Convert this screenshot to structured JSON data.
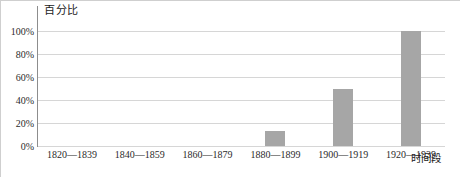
{
  "chart_data": {
    "type": "bar",
    "title": "",
    "ylabel": "百分比",
    "xlabel": "时间段",
    "categories": [
      "1820—1839",
      "1840—1859",
      "1860—1879",
      "1880—1899",
      "1900—1919",
      "1920—1939"
    ],
    "values": [
      0,
      0,
      0,
      13,
      50,
      100
    ],
    "ylim": [
      0,
      100
    ],
    "ytick_labels": [
      "0%",
      "20%",
      "40%",
      "60%",
      "80%",
      "100%"
    ],
    "ytick_values": [
      0,
      20,
      40,
      60,
      80,
      100
    ],
    "grid": true,
    "legend": false,
    "bar_color": "#a6a6a6",
    "gridline_color": "#d6d6d6",
    "axis_color": "#8d8d8d"
  }
}
